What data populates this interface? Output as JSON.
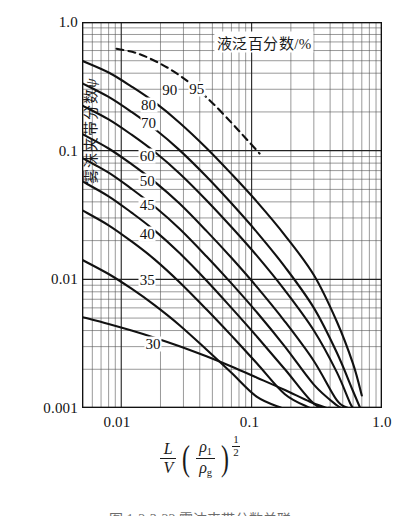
{
  "figure": {
    "caption": "图 1-2-3-22  雾沫夹带分数关联"
  },
  "chart_data": {
    "type": "line",
    "title": "",
    "xlabel": "(L/V)(ρ₁/ρg)^(1/2)",
    "ylabel": "雾沫夹带分数 ψ",
    "xscale": "log",
    "yscale": "log",
    "xlim": [
      0.005,
      1.0
    ],
    "ylim": [
      0.001,
      1.0
    ],
    "grid": true,
    "grid_minor": true,
    "legend_title": "液泛百分数/%",
    "legend_position": "in-plot-top-right",
    "xticks": [
      {
        "value": 0.01,
        "label": "0.01"
      },
      {
        "value": 0.1,
        "label": "0.1"
      },
      {
        "value": 1.0,
        "label": "1.0"
      }
    ],
    "yticks": [
      {
        "value": 0.001,
        "label": "0.001"
      },
      {
        "value": 0.01,
        "label": "0.01"
      },
      {
        "value": 0.1,
        "label": "0.1"
      },
      {
        "value": 1.0,
        "label": "1.0"
      }
    ],
    "series": [
      {
        "name": "95",
        "label": "95",
        "style": "dashed",
        "label_x": 0.038,
        "label_y": 0.3,
        "points": [
          [
            0.0092,
            0.62
          ],
          [
            0.013,
            0.575
          ],
          [
            0.018,
            0.5
          ],
          [
            0.025,
            0.415
          ],
          [
            0.035,
            0.325
          ],
          [
            0.05,
            0.235
          ],
          [
            0.07,
            0.165
          ],
          [
            0.09,
            0.125
          ],
          [
            0.115,
            0.095
          ]
        ]
      },
      {
        "name": "90",
        "label": "90",
        "style": "solid",
        "label_x": 0.0235,
        "label_y": 0.295,
        "points": [
          [
            0.005,
            0.5
          ],
          [
            0.008,
            0.405
          ],
          [
            0.012,
            0.315
          ],
          [
            0.018,
            0.238
          ],
          [
            0.028,
            0.165
          ],
          [
            0.045,
            0.105
          ],
          [
            0.07,
            0.066
          ],
          [
            0.11,
            0.04
          ],
          [
            0.18,
            0.022
          ],
          [
            0.3,
            0.0108
          ],
          [
            0.45,
            0.0047
          ],
          [
            0.6,
            0.0022
          ],
          [
            0.7,
            0.00125
          ]
        ]
      },
      {
        "name": "80",
        "label": "80",
        "style": "solid",
        "label_x": 0.0162,
        "label_y": 0.225,
        "points": [
          [
            0.005,
            0.335
          ],
          [
            0.008,
            0.262
          ],
          [
            0.012,
            0.2
          ],
          [
            0.018,
            0.148
          ],
          [
            0.028,
            0.101
          ],
          [
            0.045,
            0.063
          ],
          [
            0.07,
            0.039
          ],
          [
            0.11,
            0.0232
          ],
          [
            0.18,
            0.0125
          ],
          [
            0.3,
            0.006
          ],
          [
            0.45,
            0.0027
          ],
          [
            0.6,
            0.00135
          ],
          [
            0.68,
            0.001
          ]
        ]
      },
      {
        "name": "70",
        "label": "70",
        "style": "solid",
        "label_x": 0.0162,
        "label_y": 0.163,
        "points": [
          [
            0.005,
            0.225
          ],
          [
            0.008,
            0.175
          ],
          [
            0.012,
            0.133
          ],
          [
            0.018,
            0.098
          ],
          [
            0.028,
            0.0665
          ],
          [
            0.045,
            0.0412
          ],
          [
            0.07,
            0.0255
          ],
          [
            0.11,
            0.0152
          ],
          [
            0.18,
            0.0082
          ],
          [
            0.3,
            0.004
          ],
          [
            0.45,
            0.0019
          ],
          [
            0.58,
            0.00105
          ],
          [
            0.63,
            0.001
          ]
        ]
      },
      {
        "name": "60",
        "label": "60",
        "style": "solid",
        "label_x": 0.0158,
        "label_y": 0.0905,
        "points": [
          [
            0.005,
            0.135
          ],
          [
            0.008,
            0.104
          ],
          [
            0.012,
            0.0785
          ],
          [
            0.018,
            0.0575
          ],
          [
            0.028,
            0.0388
          ],
          [
            0.045,
            0.0238
          ],
          [
            0.07,
            0.0147
          ],
          [
            0.11,
            0.0087
          ],
          [
            0.18,
            0.0047
          ],
          [
            0.3,
            0.00232
          ],
          [
            0.45,
            0.00115
          ],
          [
            0.55,
            0.001
          ]
        ]
      },
      {
        "name": "50",
        "label": "50",
        "style": "solid",
        "label_x": 0.0158,
        "label_y": 0.0585,
        "points": [
          [
            0.005,
            0.088
          ],
          [
            0.008,
            0.0675
          ],
          [
            0.012,
            0.0505
          ],
          [
            0.018,
            0.0368
          ],
          [
            0.028,
            0.0247
          ],
          [
            0.045,
            0.0151
          ],
          [
            0.07,
            0.0093
          ],
          [
            0.11,
            0.00552
          ],
          [
            0.18,
            0.003
          ],
          [
            0.3,
            0.00152
          ],
          [
            0.45,
            0.00105
          ],
          [
            0.5,
            0.001
          ]
        ]
      },
      {
        "name": "45",
        "label": "45",
        "style": "solid",
        "label_x": 0.0158,
        "label_y": 0.0375,
        "points": [
          [
            0.005,
            0.058
          ],
          [
            0.008,
            0.0442
          ],
          [
            0.012,
            0.033
          ],
          [
            0.018,
            0.024
          ],
          [
            0.028,
            0.016
          ],
          [
            0.045,
            0.0098
          ],
          [
            0.07,
            0.006
          ],
          [
            0.11,
            0.00358
          ],
          [
            0.18,
            0.002
          ],
          [
            0.3,
            0.00108
          ],
          [
            0.4,
            0.001
          ]
        ]
      },
      {
        "name": "40",
        "label": "40",
        "style": "solid",
        "label_x": 0.0158,
        "label_y": 0.0225,
        "points": [
          [
            0.005,
            0.0345
          ],
          [
            0.008,
            0.0263
          ],
          [
            0.012,
            0.0197
          ],
          [
            0.018,
            0.0143
          ],
          [
            0.028,
            0.0095
          ],
          [
            0.045,
            0.00585
          ],
          [
            0.07,
            0.00365
          ],
          [
            0.11,
            0.00222
          ],
          [
            0.18,
            0.00128
          ],
          [
            0.28,
            0.001
          ]
        ]
      },
      {
        "name": "35",
        "label": "35",
        "style": "solid",
        "label_x": 0.0158,
        "label_y": 0.0098,
        "points": [
          [
            0.005,
            0.0142
          ],
          [
            0.008,
            0.011
          ],
          [
            0.012,
            0.00845
          ],
          [
            0.018,
            0.0063
          ],
          [
            0.028,
            0.0044
          ],
          [
            0.045,
            0.00285
          ],
          [
            0.07,
            0.00188
          ],
          [
            0.11,
            0.00122
          ],
          [
            0.17,
            0.001
          ]
        ]
      },
      {
        "name": "30",
        "label": "30",
        "style": "solid",
        "label_x": 0.0175,
        "label_y": 0.00315,
        "points": [
          [
            0.005,
            0.0051
          ],
          [
            0.008,
            0.0045
          ],
          [
            0.012,
            0.004
          ],
          [
            0.018,
            0.00352
          ],
          [
            0.028,
            0.00302
          ],
          [
            0.045,
            0.00252
          ],
          [
            0.07,
            0.0021
          ],
          [
            0.11,
            0.00172
          ],
          [
            0.18,
            0.00138
          ],
          [
            0.28,
            0.00112
          ],
          [
            0.38,
            0.001
          ]
        ]
      }
    ]
  },
  "axis_titles": {
    "y_main": "雾沫夹带分数",
    "y_symbol": "ψ",
    "x_numerator": "L",
    "x_denominator": "V",
    "x_rho_num": "ρ",
    "x_rho_num_sub": "1",
    "x_rho_den": "ρ",
    "x_rho_den_sub": "g",
    "x_exp_num": "1",
    "x_exp_den": "2",
    "paren_open": "(",
    "paren_close": ")"
  }
}
